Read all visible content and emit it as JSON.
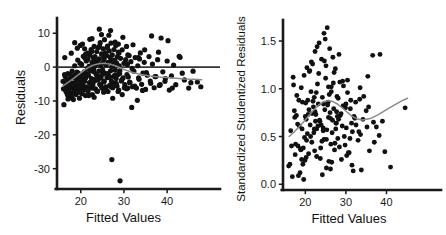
{
  "figure": {
    "background": "#ffffff",
    "point_color": "#111111",
    "loess_color": "#8a8a8a",
    "axis_color": "#1a1a1a",
    "refline_color": "#333333"
  },
  "chart_data": [
    {
      "type": "scatter",
      "panel": "left",
      "title": "",
      "xlabel": "Fitted Values",
      "ylabel": "Residuals",
      "xlim": [
        14.5,
        49
      ],
      "ylim": [
        -36,
        14.5
      ],
      "xticks": [
        20,
        30,
        40
      ],
      "xticklabels": [
        "20",
        "30",
        "40"
      ],
      "yticks": [
        10,
        0,
        -10,
        -20,
        -30
      ],
      "yticklabels": [
        "10",
        "0",
        "-10",
        "-20",
        "-30"
      ],
      "grid": false,
      "legend": "none",
      "reference_line": {
        "type": "horizontal",
        "y": 0
      },
      "smoother": {
        "name": "loess",
        "x": [
          15.8,
          17.0,
          18.2,
          19.4,
          20.6,
          21.8,
          23.0,
          24.2,
          25.4,
          26.6,
          27.8,
          29.0,
          30.2,
          32.0,
          34.0,
          36.0,
          38.0,
          40.0,
          42.0,
          44.0,
          46.0,
          48.0
        ],
        "y": [
          -5.6,
          -4.6,
          -3.5,
          -2.3,
          -1.1,
          -0.1,
          0.6,
          1.0,
          1.1,
          0.9,
          0.5,
          -0.1,
          -0.8,
          -1.6,
          -2.2,
          -2.6,
          -2.9,
          -3.1,
          -3.3,
          -3.5,
          -3.6,
          -3.7
        ]
      },
      "x": [
        15.9,
        16.1,
        16.2,
        16.4,
        16.5,
        16.6,
        16.8,
        16.9,
        17.0,
        17.1,
        17.2,
        17.3,
        17.4,
        17.5,
        17.6,
        17.7,
        17.8,
        17.9,
        18.0,
        18.1,
        18.2,
        18.3,
        18.4,
        18.5,
        18.6,
        18.7,
        18.8,
        18.9,
        19.0,
        19.1,
        19.2,
        19.3,
        19.4,
        19.5,
        19.6,
        19.7,
        19.8,
        19.9,
        20.0,
        20.1,
        20.2,
        20.3,
        20.4,
        20.5,
        20.6,
        20.7,
        20.8,
        20.9,
        21.0,
        21.1,
        21.2,
        21.3,
        21.4,
        21.5,
        21.6,
        21.7,
        21.8,
        21.9,
        22.0,
        22.1,
        22.2,
        22.3,
        22.4,
        22.5,
        22.6,
        22.7,
        22.8,
        22.9,
        23.0,
        23.1,
        23.2,
        23.3,
        23.4,
        23.5,
        23.6,
        23.7,
        23.8,
        23.9,
        24.0,
        24.1,
        24.2,
        24.3,
        24.4,
        24.5,
        24.6,
        24.7,
        24.8,
        24.9,
        25.0,
        25.1,
        25.2,
        25.3,
        25.4,
        25.5,
        25.6,
        25.7,
        25.8,
        25.9,
        26.0,
        26.1,
        26.2,
        26.3,
        26.4,
        26.5,
        26.6,
        26.7,
        26.8,
        26.9,
        27.0,
        27.1,
        27.2,
        27.3,
        27.4,
        27.5,
        27.6,
        27.7,
        27.8,
        27.9,
        28.0,
        28.1,
        28.2,
        28.3,
        28.4,
        28.5,
        28.6,
        28.7,
        28.8,
        28.9,
        29.0,
        29.2,
        29.4,
        29.6,
        29.8,
        30.0,
        30.2,
        30.4,
        30.6,
        30.8,
        31.0,
        31.2,
        31.4,
        31.6,
        31.8,
        32.0,
        32.3,
        32.6,
        32.9,
        33.2,
        33.5,
        33.8,
        34.1,
        34.4,
        34.7,
        35.0,
        35.4,
        35.8,
        36.2,
        36.6,
        37.0,
        37.4,
        37.8,
        38.2,
        38.6,
        39.0,
        39.5,
        40.0,
        40.5,
        41.0,
        41.5,
        42.0,
        43.0,
        44.0,
        45.0,
        46.0,
        47.0,
        47.8,
        16.0,
        16.3,
        16.7,
        17.05,
        17.45,
        17.85,
        18.25,
        18.65,
        19.05,
        19.45,
        19.85,
        20.25,
        20.65,
        21.05,
        21.45,
        21.85,
        22.25,
        22.65,
        23.05,
        23.45,
        23.85,
        24.25,
        24.65,
        25.05,
        25.45,
        25.85,
        26.25,
        26.65,
        27.05,
        27.45,
        27.85,
        28.25,
        28.65,
        29.05,
        29.5,
        30.1,
        30.7,
        31.3,
        31.9,
        32.5,
        33.4,
        34.3,
        35.2,
        36.1,
        37.2,
        38.4,
        39.6,
        41.2,
        43.5,
        45.5,
        16.25,
        17.15,
        18.05,
        18.95,
        19.85,
        20.75,
        21.65,
        22.55,
        23.45,
        24.35,
        25.25,
        26.15,
        27.05,
        27.95,
        28.85,
        29.75,
        30.9,
        32.1,
        33.3,
        34.8,
        36.4,
        38.0,
        40.2,
        42.8,
        30.6,
        33.6,
        19.2,
        21.1,
        23.3,
        25.4,
        27.2,
        29.1,
        20.4,
        22.6,
        24.8,
        26.9,
        18.6,
        20.9,
        23.1,
        25.3,
        27.4,
        29.6,
        17.8,
        19.9,
        22.1,
        24.3,
        26.5,
        28.7,
        30.9,
        33.1
      ],
      "y": [
        -4.2,
        -11.1,
        -6.5,
        -2.8,
        -5.1,
        -7.3,
        -3.6,
        -8.2,
        -1.9,
        -5.8,
        -6.9,
        -4.4,
        -9.1,
        -2.2,
        -7.6,
        -3.1,
        -5.4,
        -8.8,
        -1.2,
        -6.2,
        -4.8,
        -9.6,
        -2.6,
        -7.1,
        0.4,
        -5.2,
        -3.4,
        -8.1,
        -6.4,
        -1.5,
        -4.1,
        2.1,
        -7.4,
        -5.6,
        -2.9,
        -9.2,
        1.2,
        -6.1,
        -3.8,
        -4.9,
        0.8,
        -7.8,
        -2.1,
        -5.5,
        3.2,
        -6.8,
        -1.4,
        -4.2,
        2.6,
        -8.4,
        -3.1,
        1.8,
        -5.9,
        -0.6,
        4.1,
        -7.2,
        -2.4,
        0.2,
        -4.6,
        3.6,
        -6.1,
        -1.1,
        5.2,
        -3.4,
        1.4,
        -8.1,
        -5.2,
        2.8,
        -0.4,
        6.1,
        -4.1,
        3.1,
        -6.4,
        0.9,
        -2.2,
        4.6,
        -7.1,
        1.9,
        -3.8,
        5.8,
        -1.2,
        2.4,
        -5.1,
        7.2,
        0.4,
        -3.2,
        3.9,
        -6.2,
        1.1,
        -2.1,
        5.4,
        -4.4,
        2.2,
        8.1,
        -1.8,
        4.2,
        -5.8,
        0.6,
        3.4,
        -3.1,
        6.2,
        -7.2,
        1.4,
        -2.6,
        4.8,
        -5.4,
        2.9,
        -1.1,
        7.1,
        -4.2,
        0.2,
        3.6,
        -6.1,
        1.8,
        -2.8,
        5.2,
        -4.8,
        2.1,
        -0.9,
        6.4,
        -3.4,
        1.2,
        -5.6,
        3.1,
        -2.2,
        4.4,
        -6.8,
        0.4,
        -1.9,
        2.6,
        -4.1,
        5.1,
        -3.2,
        1.1,
        -5.2,
        2.2,
        -6.4,
        0.8,
        -2.9,
        3.4,
        -4.6,
        1.6,
        -11.9,
        -5.8,
        -1.2,
        2.8,
        -6.2,
        0.4,
        -3.6,
        4.2,
        -5.1,
        -1.8,
        1.4,
        -6.6,
        -2.4,
        3.1,
        -4.8,
        0.9,
        -6.1,
        -2.8,
        2.2,
        -5.4,
        8.6,
        -1.4,
        -4.2,
        1.8,
        -6.8,
        -2.6,
        0.6,
        -5.2,
        2.9,
        -3.8,
        -6.2,
        -1.2,
        -4.4,
        -5.8,
        -6.4,
        2.8,
        -6.1,
        -9.4,
        -3.9,
        -8.2,
        -5.2,
        -2.4,
        -6.8,
        -1.8,
        -4.6,
        -7.9,
        -3.2,
        -5.9,
        -2.1,
        -8.4,
        -4.8,
        -6.2,
        -1.4,
        -3.6,
        -7.1,
        -2.8,
        -5.4,
        -0.8,
        -4.2,
        -6.6,
        -1.9,
        -3.1,
        -5.8,
        0.6,
        -2.4,
        -4.9,
        -7.2,
        -1.1,
        -3.8,
        -6.1,
        -2.2,
        -4.4,
        -0.4,
        -5.6,
        -3.2,
        -6.9,
        -1.6,
        -4.1,
        -2.8,
        -5.2,
        -3.4,
        -6.2,
        -1.8,
        -4.6,
        -2.2,
        -5.8,
        -3.1,
        -4.2,
        -6.4,
        -2.6,
        2.4,
        4.6,
        1.8,
        6.2,
        3.4,
        5.8,
        2.1,
        7.4,
        4.2,
        8.8,
        3.6,
        6.6,
        2.8,
        5.1,
        9.2,
        4.4,
        7.8,
        3.2,
        6.1,
        2.4,
        5.6,
        3.8,
        0.4,
        2.9,
        -27.3,
        -33.6,
        6.8,
        8.4,
        9.6,
        10.8,
        7.2,
        5.4,
        -8.9,
        -7.4,
        -9.2,
        -8.1,
        4.1,
        6.4,
        8.2,
        11.2,
        9.4,
        6.8,
        -6.2,
        -9.8,
        -7.6,
        -8.4,
        -6.9,
        -7.8,
        -5.2,
        -6.1
      ]
    },
    {
      "type": "scatter",
      "panel": "right",
      "title": "",
      "xlabel": "Fitted Values",
      "ylabel": "Standardized Studentized Residuals",
      "xlim": [
        14.5,
        49
      ],
      "ylim": [
        -0.06,
        1.72
      ],
      "xticks": [
        20,
        30,
        40
      ],
      "xticklabels": [
        "20",
        "30",
        "40"
      ],
      "yticks": [
        0.0,
        0.5,
        1.0,
        1.5
      ],
      "yticklabels": [
        "0.0",
        "0.5",
        "1.0",
        "1.5"
      ],
      "grid": false,
      "legend": "none",
      "smoother": {
        "name": "loess",
        "x": [
          16.0,
          17.2,
          18.4,
          19.6,
          20.8,
          22.0,
          23.2,
          24.4,
          25.6,
          26.8,
          28.0,
          29.2,
          30.4,
          31.6,
          32.8,
          34.0,
          36.0,
          38.0,
          40.0,
          42.0,
          44.0,
          45.2
        ],
        "y": [
          0.5,
          0.545,
          0.6,
          0.655,
          0.715,
          0.775,
          0.825,
          0.862,
          0.876,
          0.866,
          0.838,
          0.798,
          0.752,
          0.71,
          0.683,
          0.672,
          0.688,
          0.73,
          0.782,
          0.832,
          0.878,
          0.9
        ]
      },
      "x": [
        15.9,
        16.2,
        16.6,
        17.0,
        17.3,
        17.6,
        17.9,
        18.2,
        18.5,
        18.8,
        19.0,
        19.2,
        19.4,
        19.6,
        19.8,
        20.0,
        20.2,
        20.4,
        20.6,
        20.8,
        21.0,
        21.2,
        21.4,
        21.6,
        21.8,
        22.0,
        22.2,
        22.4,
        22.6,
        22.8,
        23.0,
        23.2,
        23.4,
        23.6,
        23.8,
        24.0,
        24.2,
        24.4,
        24.6,
        24.8,
        25.0,
        25.2,
        25.4,
        25.6,
        25.8,
        26.0,
        26.2,
        26.4,
        26.6,
        26.8,
        27.0,
        27.2,
        27.4,
        27.6,
        27.8,
        28.0,
        28.3,
        28.6,
        28.9,
        29.2,
        29.5,
        29.8,
        30.1,
        30.4,
        30.8,
        31.2,
        31.6,
        32.0,
        32.5,
        33.0,
        33.5,
        34.2,
        35.0,
        35.8,
        36.6,
        37.5,
        38.4,
        39.6,
        41.0,
        44.6,
        16.4,
        17.1,
        17.8,
        18.4,
        19.1,
        19.7,
        20.3,
        20.9,
        21.5,
        22.1,
        22.7,
        23.3,
        23.9,
        24.5,
        25.1,
        25.7,
        26.3,
        26.9,
        27.5,
        28.1,
        28.8,
        29.6,
        30.4,
        31.4,
        32.4,
        33.6,
        35.2,
        37.0,
        39.0,
        16.8,
        17.5,
        18.1,
        18.7,
        19.3,
        19.9,
        20.5,
        21.1,
        21.7,
        22.3,
        22.9,
        23.5,
        24.1,
        24.7,
        25.3,
        25.9,
        26.5,
        27.1,
        27.7,
        28.4,
        29.1,
        30.0,
        31.0,
        32.2,
        33.8,
        35.6,
        38.2,
        17.4,
        18.9,
        20.1,
        21.3,
        22.5,
        23.7,
        24.9,
        26.1,
        27.3,
        28.5,
        29.9,
        31.8,
        34.4,
        36.8,
        19.5,
        20.7,
        22.8,
        24.2,
        25.5,
        26.7,
        29.4,
        31.1,
        33.2,
        35.4,
        18.3,
        21.9,
        23.1,
        24.6,
        26.2,
        27.9,
        30.6,
        33.4,
        20.2,
        22.4,
        25.2,
        26.4,
        28.2,
        30.2,
        22.2,
        24.4,
        25.7,
        27.6,
        29.3,
        31.5
      ],
      "y": [
        0.19,
        0.21,
        0.4,
        1.12,
        0.77,
        0.42,
        0.93,
        0.4,
        0.61,
        0.37,
        1.01,
        0.58,
        0.21,
        0.05,
        0.49,
        0.71,
        0.68,
        1.22,
        0.88,
        0.32,
        1.18,
        0.62,
        0.97,
        0.44,
        1.26,
        0.81,
        0.58,
        1.39,
        0.73,
        0.29,
        1.05,
        0.84,
        1.48,
        0.66,
        0.38,
        1.31,
        0.91,
        0.56,
        1.58,
        0.78,
        1.11,
        0.47,
        1.64,
        0.86,
        0.24,
        1.42,
        0.69,
        1.02,
        0.54,
        1.33,
        0.79,
        0.36,
        1.21,
        0.64,
        0.92,
        0.48,
        1.36,
        0.72,
        0.26,
        1.08,
        0.82,
        0.41,
        0.59,
        1.09,
        0.33,
        0.88,
        0.55,
        0.71,
        0.62,
        0.46,
        1.01,
        0.68,
        0.77,
        0.35,
        1.35,
        0.6,
        1.36,
        0.34,
        0.18,
        0.8,
        0.56,
        1.04,
        0.72,
        0.88,
        0.26,
        1.14,
        0.46,
        0.78,
        1.28,
        0.54,
        0.96,
        1.16,
        0.62,
        0.84,
        1.24,
        0.7,
        0.42,
        1.06,
        0.58,
        0.9,
        0.74,
        0.5,
        0.96,
        0.64,
        0.86,
        0.52,
        0.6,
        0.44,
        0.66,
        0.08,
        0.31,
        0.63,
        0.12,
        0.86,
        0.25,
        0.53,
        1.19,
        0.74,
        0.35,
        1.44,
        0.67,
        0.45,
        1.29,
        0.57,
        0.94,
        0.23,
        1.17,
        0.76,
        0.39,
        0.61,
        0.84,
        0.48,
        0.69,
        0.15,
        0.81,
        0.51,
        0.7,
        0.36,
        0.85,
        0.5,
        0.66,
        0.27,
        1.52,
        0.75,
        0.43,
        1.07,
        0.8,
        0.14,
        0.92,
        0.65,
        0.38,
        0.73,
        0.58,
        0.1,
        0.83,
        0.67,
        1.03,
        0.79,
        0.55,
        1.13,
        0.09,
        0.87,
        0.61,
        0.47,
        0.16,
        0.71,
        0.33,
        0.89,
        0.28,
        0.76,
        0.17,
        0.97,
        0.68,
        0.3,
        0.91,
        0.59,
        1.02,
        0.64,
        0.82,
        0.2,
        0.95
      ]
    }
  ]
}
